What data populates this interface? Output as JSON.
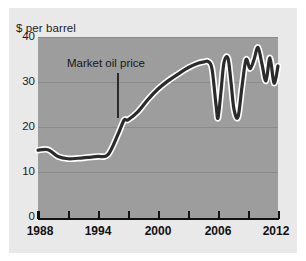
{
  "figure": {
    "background_color": "#e9e9e9",
    "plot_background_color": "#9d9d9d",
    "line_color": "#2b2b2b",
    "line_halo_color": "#ffffff"
  },
  "chart_data": {
    "type": "line",
    "title": "",
    "subtitle": "",
    "xlabel": "",
    "ylabel": "$ per barrel",
    "xlim": [
      1988,
      2012
    ],
    "ylim": [
      0,
      40
    ],
    "grid": true,
    "legend": null,
    "y_ticks": [
      0,
      10,
      20,
      30,
      40
    ],
    "y_tick_labels": [
      "0",
      "10",
      "20",
      "30",
      "40"
    ],
    "x_tick_values": [
      1988,
      1991,
      1994,
      1997,
      2000,
      2003,
      2006,
      2009,
      2012
    ],
    "x_tick_labels": [
      "1988",
      "",
      "1994",
      "",
      "2000",
      "",
      "2006",
      "",
      "2012"
    ],
    "x_major_labels": [
      "1988",
      "1994",
      "2000",
      "2006",
      "2012"
    ],
    "annotations": [
      {
        "text": "Market oil price",
        "points_to_year": 1996.5,
        "points_to_value": 21.5
      }
    ],
    "series": [
      {
        "name": "Market oil price",
        "x": [
          1988,
          1989,
          1990,
          1991,
          1992,
          1993,
          1994,
          1995,
          1996,
          1996.6,
          1997,
          1998,
          1999,
          2000,
          2001,
          2002,
          2003,
          2004,
          2004.6,
          2005,
          2005.4,
          2005.8,
          2006,
          2006.3,
          2006.6,
          2007,
          2007.3,
          2007.6,
          2008,
          2008.4,
          2008.8,
          2009.2,
          2009.6,
          2010,
          2010.4,
          2010.8,
          2011.2,
          2011.6,
          2012
        ],
        "y": [
          15.0,
          15.1,
          13.6,
          13.1,
          13.2,
          13.4,
          13.6,
          14.0,
          18.5,
          21.6,
          21.7,
          23.5,
          26.2,
          28.5,
          30.3,
          31.8,
          33.2,
          34.2,
          34.5,
          34.6,
          33.0,
          25.0,
          22.1,
          28.0,
          34.4,
          35.3,
          30.0,
          24.0,
          22.3,
          29.0,
          35.0,
          33.0,
          35.0,
          37.7,
          34.0,
          30.3,
          35.4,
          29.8,
          33.6
        ]
      }
    ]
  },
  "axis_title": "$ per barrel"
}
